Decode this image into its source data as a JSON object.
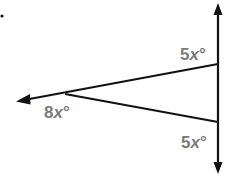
{
  "diagram": {
    "type": "geometry-angles",
    "colors": {
      "line": "#111111",
      "label": "#7a7a7a",
      "background": "#ffffff"
    },
    "vertical_line": {
      "x": 218,
      "y_top": 3,
      "y_bottom": 174,
      "arrows": "both"
    },
    "vertex": {
      "x": 65,
      "y": 94
    },
    "upper_ray": {
      "from": [
        17,
        101
      ],
      "to": [
        218,
        64
      ],
      "arrow_at": "left"
    },
    "lower_segment": {
      "from": [
        65,
        94
      ],
      "to": [
        218,
        122
      ]
    },
    "labels": [
      {
        "id": "top-right",
        "coef": "5",
        "var": "x",
        "deg": "°",
        "x": 180,
        "y": 46
      },
      {
        "id": "vertex",
        "coef": "8",
        "var": "x",
        "deg": "°",
        "x": 44,
        "y": 104
      },
      {
        "id": "bottom-right",
        "coef": "5",
        "var": "x",
        "deg": "°",
        "x": 181,
        "y": 134
      }
    ]
  }
}
